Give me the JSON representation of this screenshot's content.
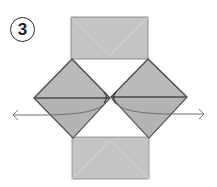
{
  "step": {
    "number": "3",
    "description": "Pull the inner flaps outward to the left and right"
  },
  "colors": {
    "paper": "#bdbdbd",
    "paper_light": "#c9c9c9",
    "crease": "#d6d6d6",
    "outline": "#555555",
    "arrow": "#7a7a7a",
    "badge": "#222222"
  },
  "arrows": [
    {
      "direction": "left",
      "label": "pull-left"
    },
    {
      "direction": "right",
      "label": "pull-right"
    }
  ]
}
